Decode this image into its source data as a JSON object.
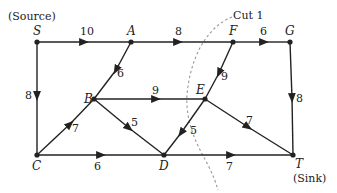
{
  "diagram": {
    "type": "flow-network",
    "annotations": {
      "source": "(Source)",
      "sink": "(Sink)",
      "cut": "Cut 1"
    },
    "nodes": [
      {
        "id": "S",
        "label": "S",
        "x": 37,
        "y": 42
      },
      {
        "id": "A",
        "label": "A",
        "x": 131,
        "y": 42
      },
      {
        "id": "F",
        "label": "F",
        "x": 233,
        "y": 42
      },
      {
        "id": "G",
        "label": "G",
        "x": 290,
        "y": 42
      },
      {
        "id": "B",
        "label": "B",
        "x": 94,
        "y": 99
      },
      {
        "id": "E",
        "label": "E",
        "x": 205,
        "y": 99
      },
      {
        "id": "C",
        "label": "C",
        "x": 37,
        "y": 155
      },
      {
        "id": "D",
        "label": "D",
        "x": 164,
        "y": 155
      },
      {
        "id": "T",
        "label": "T",
        "x": 293,
        "y": 155
      }
    ],
    "edges": [
      {
        "from": "S",
        "to": "A",
        "capacity": "10"
      },
      {
        "from": "A",
        "to": "F",
        "capacity": "8"
      },
      {
        "from": "F",
        "to": "G",
        "capacity": "6"
      },
      {
        "from": "S",
        "to": "C",
        "capacity": "8"
      },
      {
        "from": "A",
        "to": "B",
        "capacity": "6"
      },
      {
        "from": "F",
        "to": "E",
        "capacity": "9"
      },
      {
        "from": "G",
        "to": "T",
        "capacity": "8"
      },
      {
        "from": "B",
        "to": "E",
        "capacity": "9"
      },
      {
        "from": "C",
        "to": "B",
        "capacity": "7"
      },
      {
        "from": "B",
        "to": "D",
        "capacity": "5"
      },
      {
        "from": "E",
        "to": "D",
        "capacity": "5"
      },
      {
        "from": "E",
        "to": "T",
        "capacity": "7"
      },
      {
        "from": "C",
        "to": "D",
        "capacity": "6"
      },
      {
        "from": "D",
        "to": "T",
        "capacity": "7"
      }
    ]
  }
}
